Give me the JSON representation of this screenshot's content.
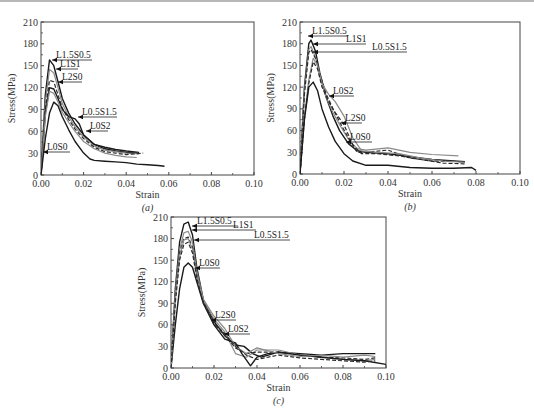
{
  "figure": {
    "panels": [
      "(a)",
      "(b)",
      "(c)"
    ]
  },
  "chart_data": [
    {
      "type": "line",
      "panel": "(a)",
      "caption": "(a)",
      "xlabel": "Strain",
      "ylabel": "Stress(MPa)",
      "xlim": [
        0,
        0.1
      ],
      "ylim": [
        0,
        210
      ],
      "xticks": [
        "0.00",
        "0.02",
        "0.04",
        "0.06",
        "0.08",
        "0.10"
      ],
      "yticks": [
        "0",
        "30",
        "60",
        "90",
        "120",
        "150",
        "180",
        "210"
      ],
      "grid": false,
      "series": [
        {
          "name": "L1.5S0.5",
          "style": "solid-dark",
          "x": [
            0,
            0.002,
            0.004,
            0.006,
            0.008,
            0.01,
            0.013,
            0.016,
            0.02,
            0.025,
            0.03,
            0.035,
            0.04,
            0.045
          ],
          "y": [
            0,
            110,
            158,
            150,
            128,
            105,
            85,
            70,
            55,
            42,
            36,
            33,
            31,
            30
          ]
        },
        {
          "name": "L1S1",
          "style": "solid-gray",
          "x": [
            0,
            0.002,
            0.004,
            0.006,
            0.008,
            0.01,
            0.013,
            0.016,
            0.02,
            0.025,
            0.03,
            0.035,
            0.04,
            0.046
          ],
          "y": [
            0,
            100,
            145,
            140,
            120,
            98,
            80,
            66,
            52,
            40,
            34,
            32,
            30,
            29
          ]
        },
        {
          "name": "L2S0",
          "style": "dashed",
          "x": [
            0,
            0.002,
            0.004,
            0.006,
            0.008,
            0.01,
            0.013,
            0.016,
            0.02,
            0.025,
            0.03,
            0.035,
            0.04,
            0.048
          ],
          "y": [
            0,
            90,
            130,
            128,
            110,
            92,
            76,
            63,
            50,
            38,
            32,
            30,
            28,
            30
          ]
        },
        {
          "name": "L0.5S1.5",
          "style": "solid-dark",
          "x": [
            0,
            0.002,
            0.004,
            0.006,
            0.008,
            0.01,
            0.013,
            0.016,
            0.018,
            0.02,
            0.025,
            0.03,
            0.035,
            0.04,
            0.046
          ],
          "y": [
            0,
            85,
            120,
            118,
            105,
            90,
            80,
            77,
            70,
            55,
            42,
            38,
            35,
            33,
            31
          ]
        },
        {
          "name": "L0S2",
          "style": "solid-gray",
          "x": [
            0,
            0.002,
            0.004,
            0.006,
            0.008,
            0.01,
            0.013,
            0.016,
            0.02,
            0.025,
            0.03,
            0.035,
            0.04,
            0.045
          ],
          "y": [
            0,
            80,
            115,
            112,
            100,
            86,
            72,
            60,
            46,
            36,
            30,
            27,
            25,
            24
          ]
        },
        {
          "name": "L0S0",
          "style": "solid-dark",
          "x": [
            0,
            0.002,
            0.004,
            0.006,
            0.008,
            0.01,
            0.013,
            0.016,
            0.02,
            0.023,
            0.025,
            0.03,
            0.035,
            0.04,
            0.045,
            0.05,
            0.055,
            0.058
          ],
          "y": [
            0,
            50,
            85,
            100,
            95,
            80,
            62,
            46,
            30,
            22,
            20,
            19,
            18,
            17,
            15,
            14,
            13,
            12
          ]
        }
      ],
      "annotations": [
        {
          "text": "L1.5S0.5",
          "x": 0.004,
          "y": 158
        },
        {
          "text": "L1S1",
          "x": 0.006,
          "y": 145
        },
        {
          "text": "L2S0",
          "x": 0.007,
          "y": 132
        },
        {
          "text": "L0.5S1.5",
          "x": 0.015,
          "y": 78
        },
        {
          "text": "L0S2",
          "x": 0.019,
          "y": 62
        },
        {
          "text": "L0S0",
          "x": 0.001,
          "y": 26
        }
      ]
    },
    {
      "type": "line",
      "panel": "(b)",
      "caption": "(b)",
      "xlabel": "Strain",
      "ylabel": "Stress(MPa)",
      "xlim": [
        0,
        0.1
      ],
      "ylim": [
        0,
        210
      ],
      "xticks": [
        "0.00",
        "0.02",
        "0.04",
        "0.06",
        "0.08",
        "0.10"
      ],
      "yticks": [
        "0",
        "30",
        "60",
        "90",
        "120",
        "150",
        "180",
        "210"
      ],
      "grid": false,
      "series": [
        {
          "name": "L1.5S0.5",
          "style": "solid-dark",
          "x": [
            0,
            0.002,
            0.004,
            0.005,
            0.007,
            0.009,
            0.012,
            0.015,
            0.018,
            0.022,
            0.026,
            0.03,
            0.04,
            0.05,
            0.06,
            0.07,
            0.075
          ],
          "y": [
            0,
            120,
            180,
            185,
            170,
            140,
            105,
            80,
            60,
            42,
            32,
            30,
            28,
            24,
            20,
            18,
            17
          ]
        },
        {
          "name": "L1S1",
          "style": "solid-gray",
          "x": [
            0,
            0.002,
            0.004,
            0.005,
            0.007,
            0.009,
            0.012,
            0.015,
            0.018,
            0.022,
            0.026,
            0.03,
            0.04,
            0.05,
            0.06,
            0.072
          ],
          "y": [
            0,
            115,
            172,
            176,
            162,
            135,
            105,
            85,
            68,
            48,
            35,
            33,
            36,
            30,
            27,
            25
          ]
        },
        {
          "name": "L0.5S1.5",
          "style": "dashed",
          "x": [
            0,
            0.002,
            0.004,
            0.005,
            0.007,
            0.009,
            0.012,
            0.015,
            0.018,
            0.022,
            0.026,
            0.03,
            0.04,
            0.05,
            0.06,
            0.075
          ],
          "y": [
            0,
            110,
            168,
            172,
            160,
            138,
            110,
            90,
            72,
            50,
            30,
            30,
            33,
            22,
            18,
            17
          ]
        },
        {
          "name": "L0S2",
          "style": "solid-gray",
          "x": [
            0,
            0.002,
            0.004,
            0.006,
            0.008,
            0.01,
            0.013,
            0.016,
            0.02,
            0.024,
            0.028,
            0.035,
            0.045,
            0.055,
            0.065,
            0.075
          ],
          "y": [
            0,
            80,
            130,
            160,
            150,
            125,
            110,
            100,
            80,
            50,
            32,
            30,
            28,
            22,
            18,
            16
          ]
        },
        {
          "name": "L2S0",
          "style": "dashed",
          "x": [
            0,
            0.002,
            0.004,
            0.006,
            0.008,
            0.01,
            0.013,
            0.016,
            0.02,
            0.024,
            0.028,
            0.035,
            0.045,
            0.055,
            0.065,
            0.075
          ],
          "y": [
            0,
            75,
            125,
            155,
            145,
            120,
            100,
            85,
            68,
            40,
            28,
            28,
            25,
            20,
            15,
            14
          ]
        },
        {
          "name": "L0S0",
          "style": "solid-dark",
          "x": [
            0,
            0.002,
            0.004,
            0.006,
            0.008,
            0.01,
            0.013,
            0.016,
            0.02,
            0.024,
            0.03,
            0.04,
            0.05,
            0.06,
            0.07,
            0.078,
            0.08
          ],
          "y": [
            0,
            75,
            120,
            127,
            115,
            90,
            65,
            45,
            28,
            18,
            12,
            12,
            9,
            8,
            8,
            9,
            5
          ]
        }
      ],
      "annotations": [
        {
          "text": "L1.5S0.5",
          "x": 0.005,
          "y": 185
        },
        {
          "text": "L1S1",
          "x": 0.005,
          "y": 176
        },
        {
          "text": "L0.5S1.5",
          "x": 0.005,
          "y": 170
        },
        {
          "text": "L0S2",
          "x": 0.01,
          "y": 111
        },
        {
          "text": "L2S0",
          "x": 0.017,
          "y": 71
        },
        {
          "text": "L0S0",
          "x": 0.014,
          "y": 44
        }
      ]
    },
    {
      "type": "line",
      "panel": "(c)",
      "caption": "(c)",
      "xlabel": "Strain",
      "ylabel": "Stress(MPa)",
      "xlim": [
        0,
        0.1
      ],
      "ylim": [
        0,
        210
      ],
      "xticks": [
        "0.00",
        "0.02",
        "0.04",
        "0.06",
        "0.08",
        "0.10"
      ],
      "yticks": [
        "0",
        "30",
        "60",
        "90",
        "120",
        "150",
        "180",
        "210"
      ],
      "grid": false,
      "series": [
        {
          "name": "L1.5S0.5",
          "style": "solid-dark",
          "x": [
            0,
            0.002,
            0.004,
            0.006,
            0.008,
            0.01,
            0.012,
            0.015,
            0.02,
            0.025,
            0.03,
            0.034,
            0.038,
            0.042,
            0.05,
            0.06,
            0.07,
            0.08,
            0.09,
            0.095
          ],
          "y": [
            0,
            110,
            175,
            200,
            203,
            185,
            140,
            95,
            65,
            45,
            32,
            30,
            20,
            15,
            22,
            20,
            18,
            20,
            20,
            20
          ]
        },
        {
          "name": "L1S1",
          "style": "solid-gray",
          "x": [
            0,
            0.002,
            0.004,
            0.006,
            0.008,
            0.01,
            0.012,
            0.015,
            0.02,
            0.025,
            0.03,
            0.035,
            0.04,
            0.05,
            0.06,
            0.07,
            0.08,
            0.09,
            0.095
          ],
          "y": [
            0,
            105,
            165,
            188,
            190,
            175,
            135,
            95,
            68,
            50,
            20,
            15,
            25,
            25,
            18,
            15,
            12,
            10,
            12
          ]
        },
        {
          "name": "L0.5S1.5",
          "style": "dashed",
          "x": [
            0,
            0.002,
            0.004,
            0.006,
            0.008,
            0.01,
            0.012,
            0.015,
            0.02,
            0.025,
            0.03,
            0.035,
            0.04,
            0.05,
            0.06,
            0.07,
            0.08,
            0.09,
            0.095
          ],
          "y": [
            0,
            100,
            160,
            180,
            182,
            168,
            130,
            92,
            62,
            45,
            28,
            20,
            22,
            22,
            18,
            15,
            14,
            12,
            14
          ]
        },
        {
          "name": "L0S0",
          "style": "solid-dark",
          "x": [
            0,
            0.002,
            0.004,
            0.006,
            0.008,
            0.01,
            0.012,
            0.015,
            0.02,
            0.025,
            0.03,
            0.033,
            0.037,
            0.04,
            0.045,
            0.05,
            0.06,
            0.07,
            0.08,
            0.09,
            0.1
          ],
          "y": [
            0,
            60,
            110,
            140,
            146,
            140,
            120,
            90,
            60,
            40,
            35,
            20,
            3,
            15,
            20,
            22,
            18,
            15,
            12,
            10,
            5
          ]
        },
        {
          "name": "L2S0",
          "style": "solid-gray",
          "x": [
            0,
            0.002,
            0.004,
            0.006,
            0.008,
            0.01,
            0.012,
            0.015,
            0.02,
            0.025,
            0.03,
            0.035,
            0.04,
            0.05,
            0.06,
            0.07,
            0.08,
            0.09,
            0.095
          ],
          "y": [
            0,
            95,
            155,
            178,
            180,
            165,
            128,
            96,
            72,
            55,
            30,
            20,
            28,
            20,
            16,
            18,
            15,
            18,
            16
          ]
        },
        {
          "name": "L0S2",
          "style": "dashed",
          "x": [
            0,
            0.002,
            0.004,
            0.006,
            0.008,
            0.01,
            0.012,
            0.015,
            0.02,
            0.025,
            0.03,
            0.035,
            0.04,
            0.05,
            0.06,
            0.07,
            0.08,
            0.09,
            0.095
          ],
          "y": [
            0,
            90,
            150,
            172,
            175,
            160,
            125,
            90,
            62,
            48,
            30,
            18,
            12,
            18,
            14,
            12,
            10,
            8,
            10
          ]
        }
      ],
      "annotations": [
        {
          "text": "L1.5S0.5",
          "x": 0.008,
          "y": 203
        },
        {
          "text": "L1S1",
          "x": 0.008,
          "y": 192
        },
        {
          "text": "L0.5S1.5",
          "x": 0.01,
          "y": 180
        },
        {
          "text": "L0S0",
          "x": 0.009,
          "y": 146
        },
        {
          "text": "L2S0",
          "x": 0.018,
          "y": 71
        },
        {
          "text": "L0S2",
          "x": 0.024,
          "y": 52
        }
      ]
    }
  ],
  "layout": {
    "panels": [
      {
        "x0": 41,
        "x1": 254,
        "y0": 175,
        "y1": 22,
        "labels": [
          {
            "text": "L1.5S0.5",
            "lx": 56,
            "ly": 58,
            "ux1": 52,
            "ux2": 92
          },
          {
            "text": "L1S1",
            "lx": 60,
            "ly": 67,
            "ux1": 56,
            "ux2": 78
          },
          {
            "text": "L2S0",
            "lx": 62,
            "ly": 80,
            "ux1": 58,
            "ux2": 82
          },
          {
            "text": "L0.5S1.5",
            "lx": 82,
            "ly": 115,
            "ux1": 78,
            "ux2": 117
          },
          {
            "text": "L0S2",
            "lx": 90,
            "ly": 129,
            "ux1": 86,
            "ux2": 108
          },
          {
            "text": "L0S0",
            "lx": 47,
            "ly": 150,
            "ux1": 43,
            "ux2": 70
          }
        ]
      },
      {
        "x0": 300,
        "x1": 520,
        "y0": 174,
        "y1": 22,
        "labels": [
          {
            "text": "L1.5S0.5",
            "lx": 312,
            "ly": 34,
            "ux1": 308,
            "ux2": 348
          },
          {
            "text": "L1S1",
            "lx": 346,
            "ly": 42,
            "ux1": 313,
            "ux2": 366
          },
          {
            "text": "L0.5S1.5",
            "lx": 372,
            "ly": 50,
            "ux1": 313,
            "ux2": 407
          },
          {
            "text": "L0S2",
            "lx": 333,
            "ly": 94,
            "ux1": 329,
            "ux2": 354
          },
          {
            "text": "L2S0",
            "lx": 345,
            "ly": 121,
            "ux1": 341,
            "ux2": 362
          },
          {
            "text": "L0S0",
            "lx": 350,
            "ly": 140,
            "ux1": 346,
            "ux2": 372
          }
        ]
      },
      {
        "x0": 171,
        "x1": 386,
        "y0": 368,
        "y1": 217,
        "labels": [
          {
            "text": "L1.5S0.5",
            "lx": 197,
            "ly": 224,
            "ux1": 192,
            "ux2": 238
          },
          {
            "text": "L1S1",
            "lx": 233,
            "ly": 228,
            "ux1": 192,
            "ux2": 256
          },
          {
            "text": "L0.5S1.5",
            "lx": 254,
            "ly": 238,
            "ux1": 194,
            "ux2": 290
          },
          {
            "text": "L0S0",
            "lx": 199,
            "ly": 266,
            "ux1": 195,
            "ux2": 220
          },
          {
            "text": "L2S0",
            "lx": 215,
            "ly": 318,
            "ux1": 211,
            "ux2": 236
          },
          {
            "text": "L0S2",
            "lx": 228,
            "ly": 332,
            "ux1": 224,
            "ux2": 250
          }
        ]
      }
    ]
  }
}
